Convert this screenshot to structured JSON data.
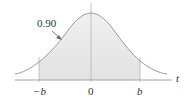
{
  "diagram": {
    "type": "t-distribution density curve with shaded central region",
    "area_label": "0.90",
    "axis_label": "t",
    "ticks": [
      {
        "label": "−b",
        "position": "left bound"
      },
      {
        "label": "0",
        "position": "center"
      },
      {
        "label": "b",
        "position": "right bound"
      }
    ],
    "colors": {
      "curve": "#9a9a9a",
      "shade": "#e4e4e4",
      "axis": "#9a9a9a",
      "arrow": "#666666",
      "text": "#333333"
    }
  }
}
